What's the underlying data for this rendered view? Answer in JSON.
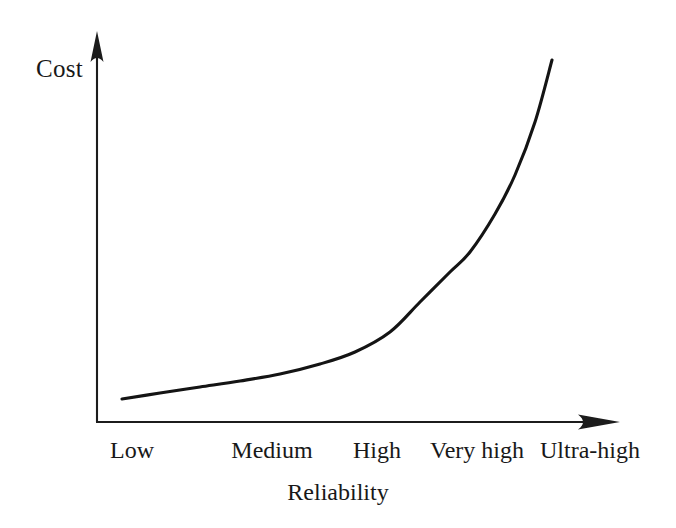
{
  "figure": {
    "background_color": "#ffffff",
    "ink_color": "#1a1a1a",
    "width": 676,
    "height": 528
  },
  "axes": {
    "y_axis_label": "Cost",
    "x_axis_label": "Reliability",
    "y_axis_arrow_icon": "arrow-up-icon",
    "x_axis_arrow_icon": "arrow-right-icon",
    "origin_x": 97,
    "origin_y": 422,
    "y_axis_top": 33,
    "x_axis_right": 618
  },
  "chart_data": {
    "type": "line",
    "title": "",
    "subtitle": "",
    "xlabel": "Reliability",
    "ylabel": "Cost",
    "categories": [
      "Low",
      "Medium",
      "High",
      "Very high",
      "Ultra-high"
    ],
    "x": [
      0,
      1,
      2,
      3,
      4
    ],
    "series": [
      {
        "name": "Cost of achieving reliability",
        "values": [
          0.06,
          0.14,
          0.27,
          0.52,
          1.0
        ]
      }
    ],
    "values": [
      0.06,
      0.14,
      0.27,
      0.52,
      1.0
    ],
    "xlim": [
      0,
      4
    ],
    "ylim": [
      0,
      1.05
    ],
    "grid": false,
    "legend": false,
    "legend_position": "none",
    "axis_ticks_numeric": false,
    "annotations": [],
    "curve_description": "Exponential growth: cost rises slowly from Low to High reliability, then climbs steeply toward Ultra-high.",
    "curve_points": [
      {
        "x": 122,
        "y": 399
      },
      {
        "x": 160,
        "y": 393
      },
      {
        "x": 200,
        "y": 387
      },
      {
        "x": 240,
        "y": 381
      },
      {
        "x": 280,
        "y": 374
      },
      {
        "x": 320,
        "y": 364
      },
      {
        "x": 355,
        "y": 352
      },
      {
        "x": 390,
        "y": 332
      },
      {
        "x": 420,
        "y": 302
      },
      {
        "x": 450,
        "y": 272
      },
      {
        "x": 470,
        "y": 252
      },
      {
        "x": 495,
        "y": 214
      },
      {
        "x": 515,
        "y": 175
      },
      {
        "x": 535,
        "y": 122
      },
      {
        "x": 552,
        "y": 60
      }
    ]
  },
  "tick_positions": [
    {
      "label": "Low",
      "cx": 132
    },
    {
      "label": "Medium",
      "cx": 272
    },
    {
      "label": "High",
      "cx": 377
    },
    {
      "label": "Very high",
      "cx": 477
    },
    {
      "label": "Ultra-high",
      "cx": 590
    }
  ]
}
